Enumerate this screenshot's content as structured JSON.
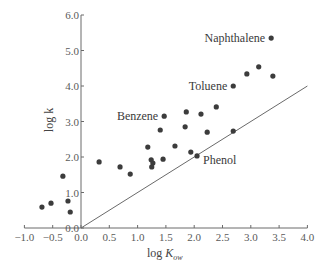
{
  "chart_data": {
    "type": "scatter",
    "title": "",
    "xlabel": "log K_ow",
    "xlabel_main": "log ",
    "xlabel_italic": "K",
    "xlabel_sub": "ow",
    "ylabel": "log k",
    "xlim": [
      -1.0,
      4.0
    ],
    "ylim": [
      0.0,
      6.0
    ],
    "x_ticks": [
      -1.0,
      -0.5,
      0.0,
      0.5,
      1.0,
      1.5,
      2.0,
      2.5,
      3.0,
      3.5,
      4.0
    ],
    "x_tick_labels": [
      "−1.0",
      "−0.5",
      "0.0",
      "0.5",
      "1.0",
      "1.5",
      "2.0",
      "2.5",
      "3.0",
      "3.5",
      "4.0"
    ],
    "y_ticks": [
      0.0,
      1.0,
      2.0,
      3.0,
      4.0,
      5.0,
      6.0
    ],
    "y_tick_labels": [
      "0.0",
      "1.0",
      "2.0",
      "3.0",
      "4.0",
      "5.0",
      "6.0"
    ],
    "grid": false,
    "legend": null,
    "reference_line": {
      "label": "y = x",
      "from": [
        0.0,
        0.0
      ],
      "to": [
        4.0,
        4.0
      ]
    },
    "series": [
      {
        "name": "compounds",
        "points": [
          {
            "x": -0.69,
            "y": 0.59
          },
          {
            "x": -0.53,
            "y": 0.7
          },
          {
            "x": -0.32,
            "y": 1.46
          },
          {
            "x": -0.23,
            "y": 0.76
          },
          {
            "x": -0.19,
            "y": 0.45
          },
          {
            "x": 0.32,
            "y": 1.86
          },
          {
            "x": 0.69,
            "y": 1.72
          },
          {
            "x": 0.87,
            "y": 1.52
          },
          {
            "x": 1.18,
            "y": 2.28
          },
          {
            "x": 1.24,
            "y": 1.92
          },
          {
            "x": 1.27,
            "y": 1.83
          },
          {
            "x": 1.25,
            "y": 1.72
          },
          {
            "x": 1.45,
            "y": 1.94
          },
          {
            "x": 1.47,
            "y": 3.15,
            "label": "Benzene"
          },
          {
            "x": 1.86,
            "y": 3.27
          },
          {
            "x": 2.12,
            "y": 3.21
          },
          {
            "x": 2.39,
            "y": 3.41
          },
          {
            "x": 1.4,
            "y": 2.76
          },
          {
            "x": 1.84,
            "y": 2.85
          },
          {
            "x": 2.23,
            "y": 2.7
          },
          {
            "x": 2.69,
            "y": 2.73
          },
          {
            "x": 1.66,
            "y": 2.31
          },
          {
            "x": 1.94,
            "y": 2.14
          },
          {
            "x": 2.05,
            "y": 2.03,
            "label": "Phenol"
          },
          {
            "x": 2.69,
            "y": 4.0,
            "label": "Toluene"
          },
          {
            "x": 2.93,
            "y": 4.34
          },
          {
            "x": 3.14,
            "y": 4.54
          },
          {
            "x": 3.39,
            "y": 4.28
          },
          {
            "x": 3.36,
            "y": 5.35,
            "label": "Naphthalene"
          }
        ]
      }
    ],
    "annotations": [
      {
        "text": "Naphthalene",
        "anchor": "end",
        "dx": -6,
        "dy": 4
      },
      {
        "text": "Toluene",
        "anchor": "end",
        "dx": -6,
        "dy": 4
      },
      {
        "text": "Benzene",
        "anchor": "end",
        "dx": -6,
        "dy": 4
      },
      {
        "text": "Phenol",
        "anchor": "start",
        "dx": 6,
        "dy": 8
      }
    ],
    "colors": {
      "point": "#3c3c3c",
      "line": "#6a6a6a",
      "axis": "#6a6a6a"
    }
  }
}
